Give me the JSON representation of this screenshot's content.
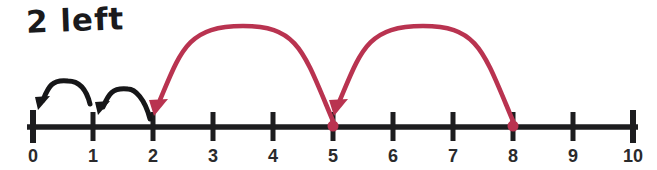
{
  "annotation": {
    "text": "2 left"
  },
  "colors": {
    "line": "#1d1d1f",
    "tick_label": "#2a2a2c",
    "jump": "#b93350",
    "hop": "#161618",
    "annotation": "#1a1a1c",
    "background": "#ffffff"
  },
  "number_line": {
    "min": 0,
    "max": 10,
    "tick_labels": [
      "0",
      "1",
      "2",
      "3",
      "4",
      "5",
      "6",
      "7",
      "8",
      "9",
      "10"
    ],
    "marked_points": [
      5,
      8
    ]
  },
  "jumps": [
    {
      "from": 8,
      "to": 5,
      "size": 3,
      "direction": "left",
      "color": "red"
    },
    {
      "from": 5,
      "to": 2,
      "size": 3,
      "direction": "left",
      "color": "red"
    }
  ],
  "hops": [
    {
      "from": 2,
      "to": 1,
      "size": 1,
      "direction": "left",
      "color": "black"
    },
    {
      "from": 1,
      "to": 0,
      "size": 1,
      "direction": "left",
      "color": "black"
    }
  ]
}
